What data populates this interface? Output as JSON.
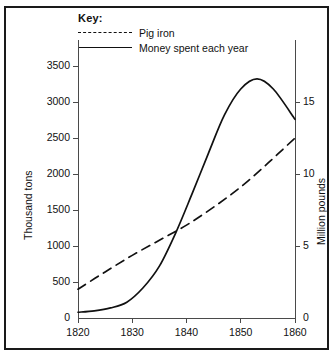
{
  "chart_data": {
    "type": "line",
    "title": "",
    "xlabel": "",
    "ylabel": "Thousand tons",
    "y2label": "Million pounds",
    "xlim": [
      1820,
      1860
    ],
    "ylim": [
      0,
      3750
    ],
    "y2lim": [
      0,
      18.75
    ],
    "grid": false,
    "legend_position": "top-center",
    "legend_title": "Key:",
    "x_ticks": [
      1820,
      1830,
      1840,
      1850,
      1860
    ],
    "x_tick_labels": [
      "1820",
      "1830",
      "1840",
      "1850",
      "1860"
    ],
    "y_ticks": [
      0,
      500,
      1000,
      1500,
      2000,
      2500,
      3000,
      3500
    ],
    "y_tick_labels": [
      "0",
      "500",
      "1000",
      "1500",
      "2000",
      "2500",
      "3000",
      "3500"
    ],
    "y2_ticks": [
      0,
      5,
      10,
      15
    ],
    "y2_tick_labels": [
      "0",
      "5",
      "10",
      "15"
    ],
    "series": [
      {
        "name": "Pig iron",
        "style": "dashed",
        "axis": "left",
        "unit": "thousand tons",
        "x": [
          1820,
          1825,
          1830,
          1835,
          1840,
          1845,
          1850,
          1855,
          1860
        ],
        "values": [
          400,
          640,
          870,
          1080,
          1290,
          1540,
          1820,
          2150,
          2500
        ]
      },
      {
        "name": "Money spent each year",
        "style": "solid",
        "axis": "right",
        "unit": "million pounds",
        "x": [
          1820,
          1823,
          1826,
          1829,
          1832,
          1835,
          1838,
          1841,
          1844,
          1847,
          1850,
          1853,
          1856,
          1860
        ],
        "values": [
          0.4,
          0.5,
          0.7,
          1.1,
          2.1,
          3.6,
          5.9,
          8.6,
          11.4,
          14.1,
          15.9,
          16.6,
          15.9,
          13.8
        ]
      }
    ]
  },
  "legend": {
    "title": "Key:",
    "items": [
      {
        "label": "Pig iron",
        "style": "dashed"
      },
      {
        "label": "Money spent each year",
        "style": "solid"
      }
    ]
  },
  "axes": {
    "left_title": "Thousand tons",
    "right_title": "Million pounds"
  }
}
